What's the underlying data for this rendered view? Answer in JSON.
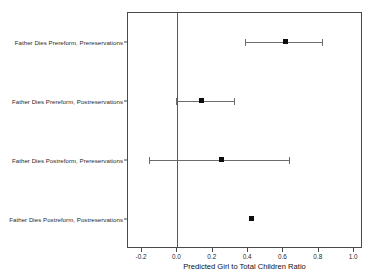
{
  "chart_data": {
    "type": "scatter",
    "subtype": "dot-and-whisker coefficient plot",
    "title": "",
    "xlabel": "Predicted Girl to Total Children Ratio",
    "ylabel": "",
    "xlim": [
      -0.28,
      1.05
    ],
    "xticks": [
      -0.2,
      0.0,
      0.2,
      0.4,
      0.6,
      0.8,
      1.0
    ],
    "xticklabels": [
      "-0.2",
      "0.0",
      "0.2",
      "0.4",
      "0.6",
      "0.8",
      "1.0"
    ],
    "grid": false,
    "legend": "none",
    "reference_line": 0.0,
    "categories": [
      "Father Dies Prereform, Prereservations",
      "Father Dies Prereform, Postreservations",
      "Father Dies Postreform, Prereservations",
      "Father Dies Postreform, Postreservations"
    ],
    "points": [
      {
        "label": "Father Dies Prereform, Prereservations",
        "estimate": 0.61,
        "ci_low": 0.38,
        "ci_high": 0.82,
        "has_interval": true
      },
      {
        "label": "Father Dies Prereform, Postreservations",
        "estimate": 0.135,
        "ci_low": -0.01,
        "ci_high": 0.32,
        "has_interval": true
      },
      {
        "label": "Father Dies Postreform, Prereservations",
        "estimate": 0.25,
        "ci_low": -0.16,
        "ci_high": 0.63,
        "has_interval": true
      },
      {
        "label": "Father Dies Postreform, Postreservations",
        "estimate": 0.42,
        "ci_low": 0.42,
        "ci_high": 0.42,
        "has_interval": false
      }
    ],
    "colors": {
      "point": "#0d0d0d",
      "interval": "#6b6b6b",
      "frame": "#4a4a4a",
      "reference_line": "#5a5a5a",
      "background": "#ffffff",
      "text": "#1f1f1f"
    }
  }
}
